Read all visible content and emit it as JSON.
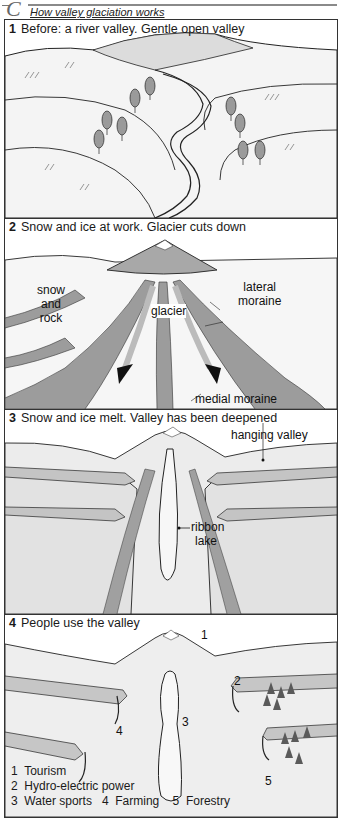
{
  "section_marker": "C",
  "figure_title": "How valley glaciation works",
  "panels": [
    {
      "number": "1",
      "heading": "Before: a river valley. Gentle open valley",
      "labels": []
    },
    {
      "number": "2",
      "heading": "Snow and ice at work. Glacier cuts down",
      "labels": {
        "snow_and_rock": [
          "snow",
          "and",
          "rock"
        ],
        "glacier": "glacier",
        "lateral_moraine": [
          "lateral",
          "moraine"
        ],
        "medial_moraine": "medial moraine"
      }
    },
    {
      "number": "3",
      "heading": "Snow and ice melt. Valley has been deepened",
      "labels": {
        "hanging_valley": "hanging valley",
        "ribbon_lake": [
          "ribbon",
          "lake"
        ]
      }
    },
    {
      "number": "4",
      "heading": "People use the valley",
      "markers": [
        "1",
        "2",
        "3",
        "4",
        "5"
      ],
      "legend": [
        "1  Tourism",
        "2  Hydro-electric power",
        "3  Water sports   4  Farming    5  Forestry"
      ]
    }
  ],
  "colors": {
    "ink": "#1a1a1a",
    "hill_fill": "#f2f2f2",
    "shade": "#b8b8b8",
    "mountain": "#9a9a9a",
    "rock": "#8c8c8c",
    "border": "#333333"
  }
}
